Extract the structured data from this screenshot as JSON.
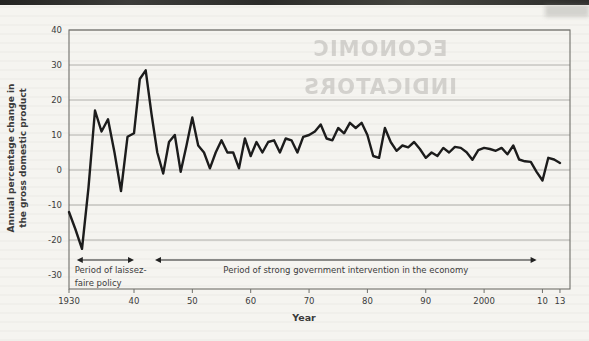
{
  "page": {
    "kind": "scanned textbook figure",
    "paper_color": "#f5f4f0",
    "top_bar_color": "#2e2e2c"
  },
  "bleed_through": {
    "line1": "ECONOMIC",
    "line2": "INDICATORS"
  },
  "chart_data": {
    "type": "line",
    "title": "",
    "xlabel": "Year",
    "ylabel": "Annual percentage change in the gross domestic product",
    "ylabel_lines": [
      "Annual percentage change in",
      "the gross domestic product"
    ],
    "ylim": [
      -30,
      40
    ],
    "grid": true,
    "gridline_values": [
      40,
      30,
      20,
      10,
      0,
      -10,
      -20
    ],
    "yticks": [
      40,
      30,
      20,
      10,
      0,
      -10,
      -20,
      -30
    ],
    "xticks": [
      {
        "label": "1930",
        "year": 1930
      },
      {
        "label": "40",
        "year": 1940
      },
      {
        "label": "50",
        "year": 1950
      },
      {
        "label": "60",
        "year": 1960
      },
      {
        "label": "70",
        "year": 1970
      },
      {
        "label": "80",
        "year": 1980
      },
      {
        "label": "90",
        "year": 1990
      },
      {
        "label": "2000",
        "year": 2000
      },
      {
        "label": "10",
        "year": 2010
      },
      {
        "label": "13",
        "year": 2013
      }
    ],
    "line_color": "#1c1c1c",
    "series": [
      {
        "name": "Annual percentage change in GDP",
        "start_year": 1930,
        "end_year": 2013,
        "values": [
          -12,
          -17,
          -22.5,
          -5,
          17,
          11,
          14.5,
          5,
          -6,
          9.5,
          10.5,
          26,
          28.5,
          16,
          5,
          -1,
          8,
          10,
          -0.5,
          7,
          15,
          7,
          5,
          0.5,
          5,
          8.5,
          5,
          5,
          0.5,
          9,
          4,
          8,
          5,
          8,
          8.5,
          5,
          9,
          8.5,
          5,
          9.5,
          10,
          11,
          13,
          9,
          8.5,
          12,
          10.5,
          13.5,
          12,
          13.5,
          10,
          4,
          3.5,
          12,
          8,
          5.5,
          7,
          6.5,
          8,
          6,
          3.5,
          5,
          4,
          6.3,
          5,
          6.6,
          6.3,
          5.1,
          2.9,
          5.7,
          6.3,
          6,
          5.5,
          6.3,
          4.5,
          7,
          3,
          2.5,
          2.3,
          -0.5,
          -3,
          3.5,
          3,
          2
        ]
      }
    ],
    "annotations": [
      {
        "text_lines": [
          "Period of laissez-",
          "faire policy"
        ],
        "arrow_span_years": [
          1931.2,
          1940
        ],
        "text_align": "left"
      },
      {
        "text_lines": [
          "Period of strong government intervention in the economy"
        ],
        "arrow_span_years": [
          1943.6,
          2009
        ],
        "text_align": "center"
      }
    ],
    "text_color": "#3b3b3b",
    "grid_color": "#9e9e9a",
    "frame_color": "#6f6f6b"
  }
}
